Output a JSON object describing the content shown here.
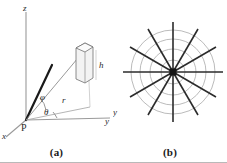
{
  "figure": {
    "panels": [
      {
        "id": "a",
        "caption": "(a)",
        "labels": {
          "z_axis": "z",
          "y_axis": "y",
          "x_axis": "x",
          "origin": "P",
          "radius": "r",
          "height": "h",
          "polar_angle": "φ",
          "azimuth_angle": "θ"
        }
      },
      {
        "id": "b",
        "caption": "(b)",
        "labels": {
          "y_axis": "y"
        },
        "radial_lines": 12,
        "circles": 4
      }
    ]
  },
  "colors": {
    "axis": "#9a9a9a",
    "ray_bold": "#1a1a1a",
    "ray_thin": "#8d8d8d",
    "web_spoke": "#2b2b2b",
    "web_circle": "#9e9e9e",
    "center_marker": "#141414",
    "text": "#2a2a2a",
    "frame": "#b9b9b9",
    "background": "#ffffff"
  }
}
